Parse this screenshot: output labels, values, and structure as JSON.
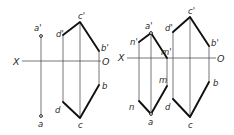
{
  "figures": [
    {
      "id": "left",
      "axis": {
        "x_label": "X",
        "o_label": "O"
      },
      "labels": {
        "a_prime": "a'",
        "a": "a",
        "b_prime": "b'",
        "b": "b",
        "c_prime": "c'",
        "c": "c",
        "d_prime": "d'",
        "d": "d"
      }
    },
    {
      "id": "right",
      "axis": {
        "x_label": "X",
        "o_label": "O"
      },
      "labels": {
        "a_prime": "a'",
        "a": "a",
        "n_prime": "n'",
        "n": "n",
        "m_prime": "m'",
        "m": "m",
        "b_prime": "b'",
        "b": "b",
        "c_prime": "c'",
        "c": "c",
        "d_prime": "d'",
        "d": "d"
      }
    }
  ],
  "colors": {
    "line": "#111111",
    "thin_line": "#4a4a4a",
    "background": "#ffffff"
  }
}
